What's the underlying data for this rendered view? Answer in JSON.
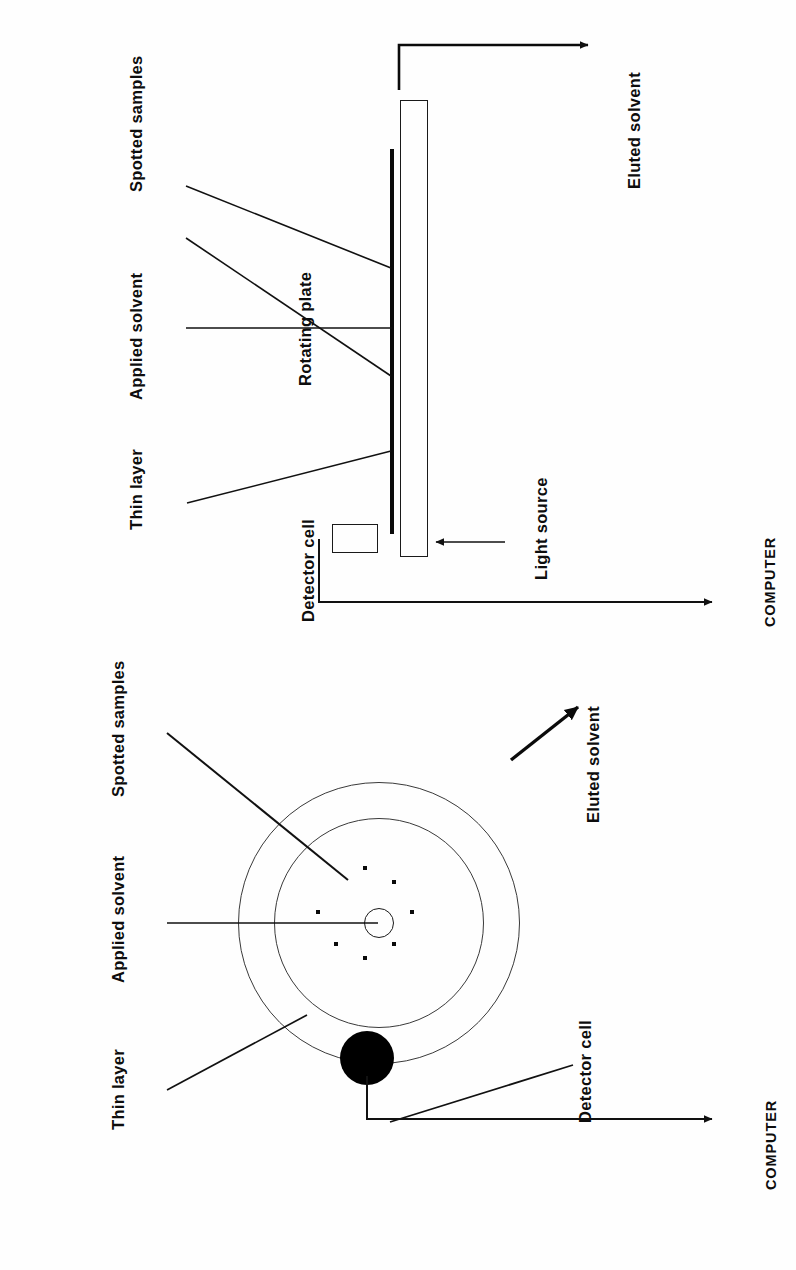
{
  "page": {
    "orientation": "rotated-90-ccw",
    "background_color": "#ffffff",
    "ink_color": "#111111",
    "title": ""
  },
  "figures": [
    {
      "id": "side-view",
      "view": "cross-section side view of rotating thin-layer chromatography plate",
      "labels": {
        "thin_layer": "Thin layer",
        "applied_solvent": "Applied solvent",
        "spotted_samples": "Spotted samples",
        "detector_cell": "Detector cell",
        "rotating_plate": "Rotating plate",
        "light_source": "Light source",
        "eluted_solvent": "Eluted solvent",
        "computer": "COMPUTER"
      }
    },
    {
      "id": "plan-view",
      "view": "plan (top-down) view of circular rotating plate",
      "labels": {
        "thin_layer": "Thin layer",
        "applied_solvent": "Applied solvent",
        "spotted_samples": "Spotted samples",
        "detector_cell": "Detector cell",
        "eluted_solvent": "Eluted solvent",
        "computer": "COMPUTER"
      },
      "spot_count": 7
    }
  ],
  "colors": {
    "ink": "#111111",
    "plate_outline": "#1a1a1a",
    "thin_layer_band": "#0a0a0a",
    "detector_cell_fill": "#000000",
    "circle_stroke": "#3a3a3a"
  }
}
